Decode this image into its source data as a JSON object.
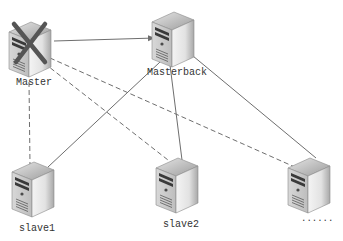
{
  "diagram": {
    "type": "network-topology",
    "nodes": [
      {
        "id": "master",
        "label": "Master",
        "status": "failed",
        "marker": "x-mark"
      },
      {
        "id": "masterback",
        "label": "Masterback"
      },
      {
        "id": "slave1",
        "label": "slave1"
      },
      {
        "id": "slave2",
        "label": "slave2"
      },
      {
        "id": "slave3",
        "label": "......"
      }
    ],
    "edges": [
      {
        "from": "master",
        "to": "masterback",
        "style": "solid",
        "arrow": true
      },
      {
        "from": "masterback",
        "to": "slave1",
        "style": "solid"
      },
      {
        "from": "masterback",
        "to": "slave2",
        "style": "solid"
      },
      {
        "from": "masterback",
        "to": "slave3",
        "style": "solid"
      },
      {
        "from": "master",
        "to": "slave1",
        "style": "dashed"
      },
      {
        "from": "master",
        "to": "slave2",
        "style": "dashed"
      },
      {
        "from": "master",
        "to": "slave3",
        "style": "dashed"
      }
    ]
  },
  "colors": {
    "line": "#6e6e6e",
    "x_mark": "#555555",
    "label": "#333333"
  }
}
